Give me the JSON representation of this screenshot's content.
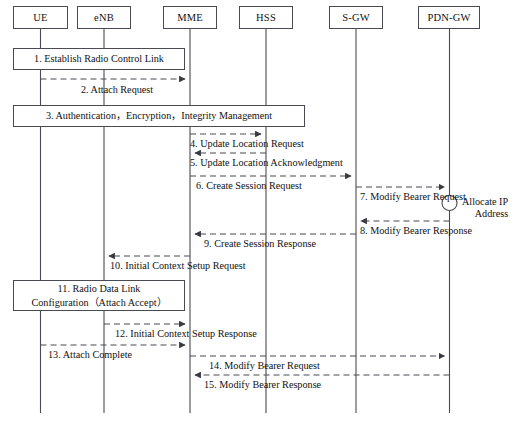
{
  "diagram": {
    "type": "sequence-diagram",
    "width": 513,
    "height": 423,
    "colors": {
      "line": "#4a4a52",
      "text": "#111111",
      "background": "#ffffff"
    },
    "actors": [
      {
        "id": "ue",
        "label": "UE",
        "box_x": 13,
        "box_w": 55,
        "lifeline_x": 40.5,
        "lifeline_y2": 413
      },
      {
        "id": "enb",
        "label": "eNB",
        "box_x": 77,
        "box_w": 54,
        "lifeline_x": 104,
        "lifeline_y2": 413
      },
      {
        "id": "mme",
        "label": "MME",
        "box_x": 163,
        "box_w": 54,
        "lifeline_x": 190,
        "lifeline_y2": 413
      },
      {
        "id": "hss",
        "label": "HSS",
        "box_x": 239,
        "box_w": 54,
        "lifeline_x": 266,
        "lifeline_y2": 413
      },
      {
        "id": "sgw",
        "label": "S-GW",
        "box_x": 329,
        "box_w": 54,
        "lifeline_x": 356,
        "lifeline_y2": 413
      },
      {
        "id": "pdngw",
        "label": "PDN-GW",
        "box_x": 418,
        "box_w": 62,
        "lifeline_x": 449.5,
        "lifeline_y2": 413
      }
    ],
    "actor_box_y": 6,
    "actor_box_h": 23,
    "activity_boxes": [
      {
        "id": "step-1",
        "lines": [
          "1. Establish Radio Control Link"
        ],
        "x": 13,
        "y": 48,
        "w": 172,
        "h": 22
      },
      {
        "id": "step-3",
        "lines": [
          "3. Authentication，Encryption，Integrity Management"
        ],
        "x": 13,
        "y": 105,
        "w": 292,
        "h": 22
      },
      {
        "id": "step-11",
        "lines": [
          "11. Radio Data Link",
          "Configuration（Attach Accept）"
        ],
        "x": 13,
        "y": 280,
        "w": 172,
        "h": 31
      }
    ],
    "messages": [
      {
        "id": "msg-2",
        "label": "2. Attach Request",
        "from": "ue",
        "to": "mme",
        "x1": 40.5,
        "x2": 190,
        "y": 79,
        "dir": "right",
        "label_x": 81,
        "label_y": 84
      },
      {
        "id": "msg-4",
        "label": "4. Update Location Request",
        "from": "mme",
        "to": "hss",
        "x1": 190,
        "x2": 266,
        "y": 134,
        "dir": "right",
        "label_x": 190,
        "label_y": 138
      },
      {
        "id": "msg-5",
        "label": "5. Update Location Acknowledgment",
        "from": "hss",
        "to": "mme",
        "x1": 266,
        "x2": 190,
        "y": 153,
        "dir": "left",
        "label_x": 190,
        "label_y": 157
      },
      {
        "id": "msg-6",
        "label": "6. Create Session Request",
        "from": "mme",
        "to": "sgw",
        "x1": 190,
        "x2": 356,
        "y": 176,
        "dir": "right",
        "label_x": 196,
        "label_y": 180
      },
      {
        "id": "msg-7",
        "label": "7. Modify Bearer Request",
        "from": "sgw",
        "to": "pdngw",
        "x1": 356,
        "x2": 449.5,
        "y": 187,
        "dir": "right",
        "label_x": 360,
        "label_y": 191
      },
      {
        "id": "msg-8",
        "label": "8. Modify Bearer Response",
        "from": "pdngw",
        "to": "sgw",
        "x1": 449.5,
        "x2": 356,
        "y": 221,
        "dir": "left",
        "label_x": 360,
        "label_y": 225
      },
      {
        "id": "msg-9",
        "label": "9. Create Session Response",
        "from": "sgw",
        "to": "mme",
        "x1": 356,
        "x2": 190,
        "y": 234,
        "dir": "left",
        "label_x": 204,
        "label_y": 238
      },
      {
        "id": "msg-10",
        "label": "10. Initial Context Setup Request",
        "from": "mme",
        "to": "enb",
        "x1": 190,
        "x2": 104,
        "y": 256,
        "dir": "left",
        "label_x": 110,
        "label_y": 260
      },
      {
        "id": "msg-12",
        "label": "12. Initial Context Setup Response",
        "from": "enb",
        "to": "mme",
        "x1": 104,
        "x2": 190,
        "y": 324,
        "dir": "right",
        "label_x": 115,
        "label_y": 328
      },
      {
        "id": "msg-13",
        "label": "13. Attach Complete",
        "from": "ue",
        "to": "mme",
        "x1": 40.5,
        "x2": 190,
        "y": 345,
        "dir": "right",
        "label_x": 48,
        "label_y": 349
      },
      {
        "id": "msg-14",
        "label": "14. Modify Bearer Request",
        "from": "mme",
        "to": "pdngw",
        "x1": 190,
        "x2": 449.5,
        "y": 356,
        "dir": "right",
        "label_x": 209,
        "label_y": 360
      },
      {
        "id": "msg-15",
        "label": "15. Modify Bearer Response",
        "from": "pdngw",
        "to": "mme",
        "x1": 449.5,
        "x2": 190,
        "y": 375,
        "dir": "left",
        "label_x": 204,
        "label_y": 379
      }
    ],
    "notes": [
      {
        "id": "allocate-ip-note",
        "lines": [
          "Allocate IP",
          "Address"
        ],
        "circle_cx": 449.5,
        "circle_cy": 203,
        "circle_r": 7.5,
        "text_x": 462,
        "text_y": 196
      }
    ]
  }
}
